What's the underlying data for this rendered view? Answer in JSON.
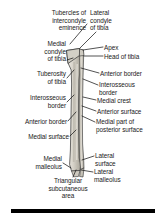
{
  "figure": {
    "background_color": "#ffffff",
    "ink_color": "#1a1a1a",
    "bone_fill_color": "#d9d6cd",
    "bone_shadow_color": "#b3afa4",
    "bone_outline_color": "#2b2b2b"
  },
  "labels": [
    {
      "id": "tubercles-of-intercondyle-eminence",
      "text": "Tubercles of\nintercondyle\neminence",
      "align": "right",
      "x": 86,
      "y": 9,
      "leader": [
        [
          87,
          24
        ],
        [
          70,
          44
        ]
      ]
    },
    {
      "id": "lateral-condyle-of-tibia",
      "text": "Lateral\ncondyle\nof tibia",
      "align": "left",
      "x": 90,
      "y": 9,
      "leader": [
        [
          96,
          32
        ],
        [
          80,
          48
        ]
      ]
    },
    {
      "id": "medial-condyle-of-tibia",
      "text": "Medial\ncondyle\nof tibia",
      "align": "right",
      "x": 66,
      "y": 40,
      "leader": [
        [
          67,
          60
        ],
        [
          73,
          58
        ]
      ]
    },
    {
      "id": "apex",
      "text": "Apex",
      "align": "left",
      "x": 104,
      "y": 44,
      "leader": [
        [
          103,
          47
        ],
        [
          83,
          50
        ]
      ]
    },
    {
      "id": "head-of-tibia",
      "text": "Head of tibia",
      "align": "left",
      "x": 104,
      "y": 53,
      "leader": [
        [
          103,
          56
        ],
        [
          84,
          56
        ]
      ]
    },
    {
      "id": "tuberosity-of-tibia",
      "text": "Tuberosity\nof tibia",
      "align": "right",
      "x": 66,
      "y": 70,
      "leader": [
        [
          67,
          78
        ],
        [
          74,
          70
        ]
      ]
    },
    {
      "id": "anterior-border-right",
      "text": "Anterior border",
      "align": "left",
      "x": 100,
      "y": 70,
      "leader": [
        [
          99,
          73
        ],
        [
          81,
          68
        ]
      ]
    },
    {
      "id": "interosseous-border-right",
      "text": "Interosseous\nborder",
      "align": "left",
      "x": 99,
      "y": 81,
      "leader": [
        [
          98,
          85
        ],
        [
          83,
          79
        ]
      ]
    },
    {
      "id": "interosseous-border-left",
      "text": "Interosseous\nborder",
      "align": "right",
      "x": 66,
      "y": 94,
      "leader": [
        [
          67,
          102
        ],
        [
          74,
          95
        ]
      ]
    },
    {
      "id": "medial-crest",
      "text": "Medial crest",
      "align": "left",
      "x": 97,
      "y": 97,
      "leader": [
        [
          96,
          100
        ],
        [
          83,
          97
        ]
      ]
    },
    {
      "id": "anterior-surface",
      "text": "Anterior surface",
      "align": "left",
      "x": 97,
      "y": 108,
      "leader": [
        [
          96,
          111
        ],
        [
          82,
          106
        ]
      ]
    },
    {
      "id": "anterior-border-left",
      "text": "Anterior border",
      "align": "right",
      "x": 67,
      "y": 118,
      "leader": [
        [
          68,
          121
        ],
        [
          76,
          112
        ]
      ]
    },
    {
      "id": "medial-part-of-posterior-surface",
      "text": "Medial part of\nposterior surface",
      "align": "left",
      "x": 96,
      "y": 118,
      "leader": [
        [
          95,
          122
        ],
        [
          82,
          116
        ]
      ]
    },
    {
      "id": "medial-surface",
      "text": "Medial surface",
      "align": "right",
      "x": 69,
      "y": 133,
      "leader": [
        [
          70,
          136
        ],
        [
          76,
          130
        ]
      ]
    },
    {
      "id": "lateral-surface",
      "text": "Lateral\nsurface",
      "align": "left",
      "x": 95,
      "y": 152,
      "leader": [
        [
          94,
          156
        ],
        [
          82,
          160
        ]
      ]
    },
    {
      "id": "medial-malleolus",
      "text": "Medial\nmalleolus",
      "align": "right",
      "x": 62,
      "y": 155,
      "leader": [
        [
          63,
          163
        ],
        [
          71,
          168
        ]
      ]
    },
    {
      "id": "lateral-malleolus",
      "text": "Lateral\nmalleolus",
      "align": "left",
      "x": 94,
      "y": 168,
      "leader": [
        [
          93,
          172
        ],
        [
          81,
          170
        ]
      ]
    },
    {
      "id": "triangular-subcutaneous-area",
      "text": "Triangular\nsubcutaneous\narea",
      "align": "center",
      "x": 68,
      "y": 177,
      "leader": [
        [
          73,
          177
        ],
        [
          76,
          170
        ]
      ]
    }
  ],
  "scale_bar": {
    "name": "scale-bar",
    "x": 11,
    "y": 209,
    "width": 144,
    "height": 4,
    "color": "#000000"
  }
}
